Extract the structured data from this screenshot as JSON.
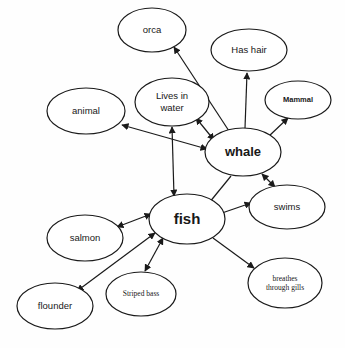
{
  "diagram": {
    "type": "concept-map",
    "background_color": "#fefefe",
    "stroke_color": "#1a1a1a",
    "text_color": "#181818",
    "nodes": [
      {
        "id": "orca",
        "label": "orca",
        "cx": 152,
        "cy": 30,
        "rx": 34,
        "ry": 22,
        "font": "sans",
        "size": "md",
        "bold": false
      },
      {
        "id": "hashair",
        "label": "Has hair",
        "cx": 249,
        "cy": 50,
        "rx": 38,
        "ry": 21,
        "font": "sans",
        "size": "md",
        "bold": false
      },
      {
        "id": "mammal",
        "label": "Mammal",
        "cx": 298,
        "cy": 100,
        "rx": 33,
        "ry": 19,
        "font": "sans",
        "size": "sm",
        "bold": true
      },
      {
        "id": "lives",
        "label": "Lives in\nwater",
        "cx": 172,
        "cy": 102,
        "rx": 37,
        "ry": 24,
        "font": "sans",
        "size": "md",
        "bold": false
      },
      {
        "id": "animal",
        "label": "animal",
        "cx": 86,
        "cy": 111,
        "rx": 39,
        "ry": 23,
        "font": "sans",
        "size": "md",
        "bold": false
      },
      {
        "id": "whale",
        "label": "whale",
        "cx": 243,
        "cy": 152,
        "rx": 38,
        "ry": 24,
        "font": "sans",
        "size": "lg",
        "bold": true
      },
      {
        "id": "swims",
        "label": "swims",
        "cx": 287,
        "cy": 207,
        "rx": 38,
        "ry": 22,
        "font": "sans",
        "size": "md",
        "bold": false
      },
      {
        "id": "fish",
        "label": "fish",
        "cx": 187,
        "cy": 219,
        "rx": 38,
        "ry": 25,
        "font": "sans",
        "size": "xl",
        "bold": true
      },
      {
        "id": "salmon",
        "label": "salmon",
        "cx": 85,
        "cy": 238,
        "rx": 38,
        "ry": 23,
        "font": "sans",
        "size": "md",
        "bold": false
      },
      {
        "id": "gills",
        "label": "breathes\nthrough gills",
        "cx": 285,
        "cy": 283,
        "rx": 37,
        "ry": 25,
        "font": "serif",
        "size": "sm",
        "bold": false
      },
      {
        "id": "striped",
        "label": "Striped bass",
        "cx": 141,
        "cy": 294,
        "rx": 35,
        "ry": 22,
        "font": "serif",
        "size": "sm",
        "bold": false
      },
      {
        "id": "flounder",
        "label": "flounder",
        "cx": 55,
        "cy": 306,
        "rx": 38,
        "ry": 23,
        "font": "sans",
        "size": "md",
        "bold": false
      }
    ],
    "edges": [
      {
        "from": "whale",
        "to": "orca",
        "arrow": "single",
        "x1": 229,
        "y1": 131,
        "x2": 174,
        "y2": 47
      },
      {
        "from": "whale",
        "to": "hashair",
        "arrow": "single",
        "x1": 245,
        "y1": 128,
        "x2": 247,
        "y2": 73
      },
      {
        "from": "whale",
        "to": "mammal",
        "arrow": "single",
        "x1": 268,
        "y1": 137,
        "x2": 288,
        "y2": 118
      },
      {
        "from": "whale",
        "to": "lives",
        "arrow": "double",
        "x1": 214,
        "y1": 140,
        "x2": 196,
        "y2": 118
      },
      {
        "from": "whale",
        "to": "animal",
        "arrow": "double",
        "x1": 207,
        "y1": 149,
        "x2": 122,
        "y2": 125
      },
      {
        "from": "whale",
        "to": "swims",
        "arrow": "double",
        "x1": 262,
        "y1": 174,
        "x2": 275,
        "y2": 187
      },
      {
        "from": "fish",
        "to": "whale",
        "arrow": "none",
        "x1": 209,
        "y1": 203,
        "x2": 231,
        "y2": 176
      },
      {
        "from": "fish",
        "to": "lives",
        "arrow": "double",
        "x1": 174,
        "y1": 196,
        "x2": 172,
        "y2": 127
      },
      {
        "from": "fish",
        "to": "swims",
        "arrow": "single",
        "x1": 222,
        "y1": 213,
        "x2": 251,
        "y2": 203
      },
      {
        "from": "fish",
        "to": "gills",
        "arrow": "single",
        "x1": 213,
        "y1": 238,
        "x2": 254,
        "y2": 268
      },
      {
        "from": "fish",
        "to": "salmon",
        "arrow": "double",
        "x1": 151,
        "y1": 214,
        "x2": 117,
        "y2": 227
      },
      {
        "from": "fish",
        "to": "striped",
        "arrow": "double",
        "x1": 163,
        "y1": 238,
        "x2": 145,
        "y2": 271
      },
      {
        "from": "fish",
        "to": "flounder",
        "arrow": "double",
        "x1": 155,
        "y1": 233,
        "x2": 77,
        "y2": 291
      }
    ]
  }
}
